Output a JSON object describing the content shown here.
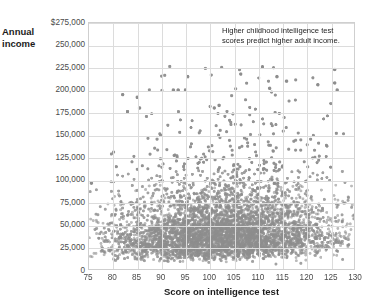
{
  "chart_data": {
    "type": "scatter",
    "title": "",
    "xlabel": "Score on intelligence test",
    "ylabel": "Annual income",
    "ylabel_lines": [
      "Annual",
      "income"
    ],
    "annotation": "Higher childhood intelligence test scores predict higher adult income.",
    "xlim": [
      75,
      130
    ],
    "ylim": [
      0,
      275000
    ],
    "grid": true,
    "legend": "none",
    "point_color": "#8d8d8d",
    "grid_color": "#dcdcdc",
    "axis_color": "#cfcfcf",
    "xticks": [
      75,
      80,
      85,
      90,
      95,
      100,
      105,
      110,
      115,
      120,
      125,
      130
    ],
    "xtick_labels": [
      "75",
      "80",
      "85",
      "90",
      "95",
      "100",
      "105",
      "110",
      "115",
      "120",
      "125",
      "130"
    ],
    "yticks": [
      0,
      25000,
      50000,
      75000,
      100000,
      125000,
      150000,
      175000,
      200000,
      225000,
      250000,
      275000
    ],
    "ytick_labels": [
      "0",
      "25,000",
      "50,000",
      "75,000",
      "100,000",
      "125,000",
      "150,000",
      "175,000",
      "200,000",
      "225,000",
      "250,000",
      "$275,000"
    ],
    "n_points": 2200,
    "distribution": {
      "x_range": [
        75,
        130
      ],
      "x_mode": 103,
      "income_bulk_max": 75000,
      "income_upper_outliers": 225000,
      "trend": "upper tail of income increases with test score"
    },
    "notable_points": [
      {
        "x": 82,
        "y": 195000
      },
      {
        "x": 83,
        "y": 176000
      },
      {
        "x": 85,
        "y": 192000
      },
      {
        "x": 85.5,
        "y": 180000
      },
      {
        "x": 92.5,
        "y": 200000
      },
      {
        "x": 93.5,
        "y": 200000
      },
      {
        "x": 95,
        "y": 200000
      },
      {
        "x": 95.5,
        "y": 215000
      },
      {
        "x": 101,
        "y": 180000
      },
      {
        "x": 102,
        "y": 183000
      },
      {
        "x": 106.5,
        "y": 218000
      },
      {
        "x": 111,
        "y": 226000
      },
      {
        "x": 112.5,
        "y": 202000
      },
      {
        "x": 114,
        "y": 215000
      },
      {
        "x": 116,
        "y": 210000
      },
      {
        "x": 122.5,
        "y": 206000
      },
      {
        "x": 126,
        "y": 223000
      },
      {
        "x": 126,
        "y": 208000
      },
      {
        "x": 126.5,
        "y": 200000
      },
      {
        "x": 75.5,
        "y": 96000
      }
    ]
  }
}
